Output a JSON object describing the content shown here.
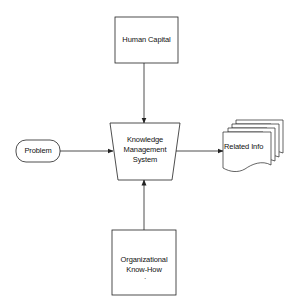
{
  "diagram": {
    "type": "flowchart",
    "colors": {
      "stroke": "#222222",
      "background": "#ffffff",
      "text": "#111111"
    },
    "nodes": {
      "human_capital": {
        "label": "Human Capital",
        "shape": "rectangle"
      },
      "kms": {
        "line1": "Knowledge",
        "line2": "Management",
        "line3": "System",
        "shape": "trapezoid"
      },
      "problem": {
        "label": "Problem",
        "shape": "rounded-terminator"
      },
      "related_info": {
        "label": "Related Info",
        "shape": "multi-document"
      },
      "org_knowhow": {
        "line1": "Organizational",
        "line2": "Know-How",
        "dot": "·",
        "shape": "rectangle"
      }
    },
    "edges": [
      {
        "from": "Human Capital",
        "to": "Knowledge Management System"
      },
      {
        "from": "Problem",
        "to": "Knowledge Management System"
      },
      {
        "from": "Organizational Know-How",
        "to": "Knowledge Management System"
      },
      {
        "from": "Knowledge Management System",
        "to": "Related Info"
      }
    ]
  }
}
